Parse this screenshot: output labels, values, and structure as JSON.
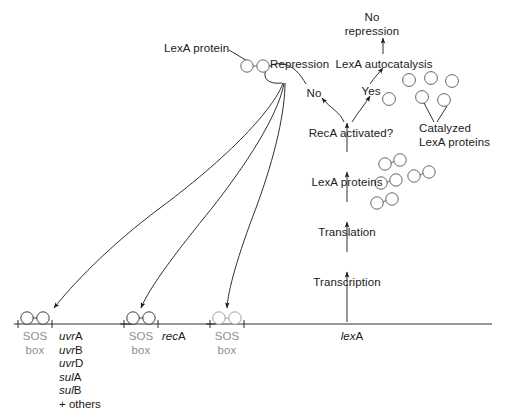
{
  "diagram": {
    "colors": {
      "stroke": "#1a1a1a",
      "protein_stroke": "#555555",
      "gray_text": "#8e8e8e",
      "background": "#ffffff"
    }
  },
  "labels": {
    "lexa_protein": "LexA protein",
    "repression": "Repression",
    "no": "No",
    "yes": "Yes",
    "reca_activated": "RecA activated?",
    "lexa_autocatalysis": "LexA autocatalysis",
    "no_repression_line1": "No",
    "no_repression_line2": "repression",
    "catalyzed_line1": "Catalyzed",
    "catalyzed_line2": "LexA proteins",
    "lexa_proteins": "LexA proteins",
    "translation": "Translation",
    "transcription": "Transcription"
  },
  "operons": [
    {
      "id": "sos-operon-uvr",
      "box_line1": "SOS",
      "box_line2": "box",
      "genes": [
        {
          "prefix": "uvr",
          "suffix": "A"
        },
        {
          "prefix": "uvr",
          "suffix": "B"
        },
        {
          "prefix": "uvr",
          "suffix": "D"
        },
        {
          "prefix": "sul",
          "suffix": "A"
        },
        {
          "prefix": "sul",
          "suffix": "B"
        },
        {
          "prefix": "",
          "suffix": "+ others"
        }
      ]
    },
    {
      "id": "sos-operon-reca",
      "box_line1": "SOS",
      "box_line2": "box",
      "genes": [
        {
          "prefix": "rec",
          "suffix": "A"
        }
      ]
    },
    {
      "id": "sos-operon-lexa",
      "box_line1": "SOS",
      "box_line2": "box",
      "genes": [
        {
          "prefix": "lex",
          "suffix": "A"
        }
      ]
    }
  ],
  "protein_clusters": {
    "lexa_dimers_count": 4,
    "catalyzed_monomers_count": 6,
    "repressor_dimer_count": 1
  }
}
